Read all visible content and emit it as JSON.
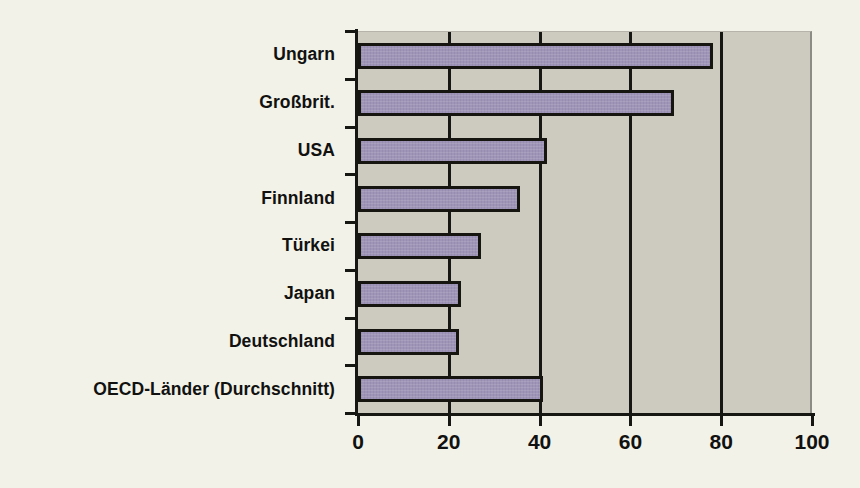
{
  "chart_data": {
    "type": "bar",
    "orientation": "horizontal",
    "title": "",
    "subtitle": "",
    "xlabel": "",
    "ylabel": "",
    "categories": [
      "Ungarn",
      "Großbrit.",
      "USA",
      "Finnland",
      "Türkei",
      "Japan",
      "Deutschland",
      "OECD-Länder (Durchschnitt)"
    ],
    "values": [
      77.5,
      69,
      41,
      35,
      26.5,
      22,
      21.5,
      40
    ],
    "xlim": [
      0,
      100
    ],
    "xticks": [
      0,
      20,
      40,
      60,
      80,
      100
    ],
    "xtick_labels": [
      "0",
      "20",
      "40",
      "60",
      "80",
      "100"
    ],
    "gridlines": [
      20,
      40,
      60,
      80
    ],
    "grid": true,
    "legend": null,
    "series": [
      {
        "name": "",
        "values": [
          77.5,
          69,
          41,
          35,
          26.5,
          22,
          21.5,
          40
        ]
      }
    ]
  },
  "colors": {
    "page_background": "#f2f2e8",
    "plot_background": "#cdcbc0",
    "bar_fill": "#9f95b8",
    "bar_outline": "#17150f",
    "axis": "#161612",
    "text": "#111110"
  }
}
